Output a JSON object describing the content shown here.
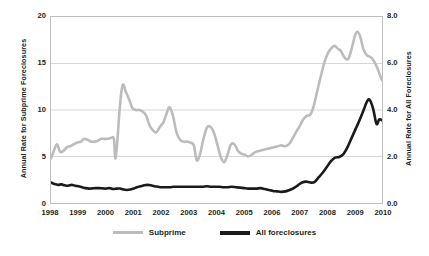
{
  "chart_data": {
    "type": "line",
    "title": "",
    "xlabel": "",
    "grid": "horizontal",
    "legend_position": "bottom",
    "x_ticks": [
      "1998",
      "1999",
      "2000",
      "2001",
      "2002",
      "2003",
      "2004",
      "2005",
      "2006",
      "2007",
      "2008",
      "2009",
      "2010"
    ],
    "xlim": [
      1998,
      2010
    ],
    "axes": {
      "left": {
        "label": "Annual Rate for Subprime Foreclosures",
        "ticks": [
          "0",
          "5",
          "10",
          "15",
          "20"
        ],
        "lim": [
          0,
          20
        ]
      },
      "right": {
        "label": "Annual Rate for All Foreclosures",
        "ticks": [
          "0.0",
          "2.0",
          "4.0",
          "6.0",
          "8.0"
        ],
        "lim": [
          0,
          8
        ]
      }
    },
    "series": [
      {
        "name": "Subprime",
        "axis": "left",
        "color": "#bcbcbc",
        "x": [
          1998.0,
          1998.1,
          1998.22,
          1998.33,
          1998.45,
          1998.58,
          1998.7,
          1998.82,
          1998.95,
          1999.08,
          1999.2,
          1999.33,
          1999.45,
          1999.58,
          1999.7,
          1999.82,
          1999.95,
          2000.05,
          2000.18,
          2000.28,
          2000.33,
          2000.4,
          2000.5,
          2000.6,
          2000.72,
          2000.85,
          2000.95,
          2001.08,
          2001.2,
          2001.33,
          2001.45,
          2001.58,
          2001.7,
          2001.82,
          2001.95,
          2002.08,
          2002.2,
          2002.3,
          2002.42,
          2002.55,
          2002.68,
          2002.8,
          2002.92,
          2003.05,
          2003.18,
          2003.28,
          2003.4,
          2003.52,
          2003.65,
          2003.78,
          2003.9,
          2004.02,
          2004.15,
          2004.28,
          2004.4,
          2004.52,
          2004.65,
          2004.78,
          2004.9,
          2005.02,
          2005.15,
          2005.28,
          2005.42,
          2005.55,
          2005.68,
          2005.82,
          2005.95,
          2006.08,
          2006.22,
          2006.35,
          2006.48,
          2006.62,
          2006.75,
          2006.88,
          2007.02,
          2007.15,
          2007.28,
          2007.4,
          2007.52,
          2007.65,
          2007.78,
          2007.9,
          2008.02,
          2008.15,
          2008.28,
          2008.4,
          2008.52,
          2008.65,
          2008.78,
          2008.9,
          2009.02,
          2009.12,
          2009.22,
          2009.32,
          2009.45,
          2009.58,
          2009.7,
          2009.82,
          2009.92,
          2010.0
        ],
        "y": [
          4.8,
          5.6,
          6.3,
          5.5,
          5.6,
          6.0,
          6.1,
          6.3,
          6.5,
          6.6,
          6.9,
          6.8,
          6.6,
          6.6,
          6.7,
          6.9,
          6.9,
          6.9,
          7.0,
          6.9,
          4.8,
          6.5,
          10.5,
          12.7,
          11.9,
          11.0,
          10.2,
          10.0,
          10.0,
          9.8,
          9.4,
          8.3,
          7.8,
          7.6,
          8.2,
          8.7,
          9.7,
          10.3,
          9.4,
          7.6,
          6.8,
          6.6,
          6.6,
          6.5,
          6.2,
          4.6,
          5.2,
          6.8,
          8.1,
          8.2,
          7.6,
          6.4,
          5.0,
          4.4,
          5.2,
          6.3,
          6.3,
          5.6,
          5.3,
          5.2,
          5.0,
          5.2,
          5.5,
          5.6,
          5.7,
          5.8,
          5.9,
          6.0,
          6.1,
          6.2,
          6.1,
          6.3,
          6.9,
          7.6,
          8.3,
          9.0,
          9.4,
          9.5,
          10.4,
          12.0,
          13.6,
          15.0,
          16.0,
          16.6,
          16.9,
          16.6,
          16.3,
          15.6,
          15.5,
          16.6,
          18.0,
          18.4,
          17.8,
          16.6,
          15.9,
          15.7,
          15.3,
          14.6,
          13.8,
          13.2
        ]
      },
      {
        "name": "All foreclosures",
        "axis": "right",
        "color": "#1a1a1a",
        "x": [
          1998.0,
          1998.12,
          1998.25,
          1998.38,
          1998.5,
          1998.62,
          1998.75,
          1998.88,
          1999.0,
          1999.12,
          1999.25,
          1999.38,
          1999.5,
          1999.62,
          1999.75,
          1999.88,
          2000.0,
          2000.12,
          2000.25,
          2000.38,
          2000.5,
          2000.62,
          2000.75,
          2000.88,
          2001.0,
          2001.12,
          2001.25,
          2001.38,
          2001.5,
          2001.62,
          2001.75,
          2001.88,
          2002.0,
          2002.15,
          2002.3,
          2002.45,
          2002.6,
          2002.75,
          2002.9,
          2003.05,
          2003.2,
          2003.35,
          2003.5,
          2003.65,
          2003.8,
          2003.95,
          2004.1,
          2004.25,
          2004.4,
          2004.55,
          2004.7,
          2004.85,
          2005.0,
          2005.15,
          2005.3,
          2005.45,
          2005.6,
          2005.75,
          2005.9,
          2006.05,
          2006.2,
          2006.35,
          2006.5,
          2006.65,
          2006.8,
          2006.95,
          2007.1,
          2007.25,
          2007.4,
          2007.55,
          2007.7,
          2007.85,
          2008.0,
          2008.15,
          2008.3,
          2008.45,
          2008.6,
          2008.75,
          2008.9,
          2009.05,
          2009.2,
          2009.35,
          2009.45,
          2009.55,
          2009.68,
          2009.8,
          2009.9,
          2010.0
        ],
        "y": [
          0.88,
          0.82,
          0.78,
          0.8,
          0.76,
          0.74,
          0.78,
          0.74,
          0.72,
          0.68,
          0.64,
          0.62,
          0.63,
          0.64,
          0.64,
          0.63,
          0.62,
          0.64,
          0.6,
          0.62,
          0.62,
          0.58,
          0.56,
          0.58,
          0.62,
          0.68,
          0.72,
          0.76,
          0.78,
          0.76,
          0.72,
          0.7,
          0.68,
          0.68,
          0.68,
          0.7,
          0.7,
          0.7,
          0.7,
          0.7,
          0.7,
          0.7,
          0.7,
          0.72,
          0.7,
          0.7,
          0.7,
          0.68,
          0.68,
          0.7,
          0.68,
          0.66,
          0.64,
          0.62,
          0.62,
          0.62,
          0.64,
          0.6,
          0.56,
          0.52,
          0.5,
          0.48,
          0.5,
          0.56,
          0.64,
          0.76,
          0.88,
          0.92,
          0.88,
          0.9,
          1.1,
          1.3,
          1.55,
          1.8,
          1.95,
          1.98,
          2.1,
          2.4,
          2.8,
          3.2,
          3.6,
          4.05,
          4.35,
          4.45,
          4.05,
          3.4,
          3.6,
          3.55
        ]
      }
    ]
  },
  "legend": {
    "items": [
      {
        "label": "Subprime"
      },
      {
        "label": "All foreclosures"
      }
    ]
  }
}
